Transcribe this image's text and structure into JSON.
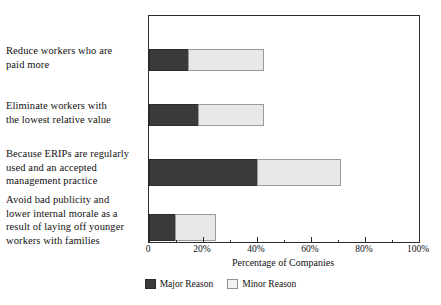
{
  "chart_data": {
    "type": "bar",
    "orientation": "horizontal",
    "stacked": true,
    "title": "",
    "xlabel": "Percentage of Companies",
    "ylabel": "",
    "xlim": [
      0,
      100
    ],
    "grid": false,
    "legend_position": "bottom-center",
    "categories": [
      "Reduce workers who are paid more",
      "Eliminate workers with the lowest relative value",
      "Because ERIPs are regularly used and an accepted management practice",
      "Avoid bad publicity and lower internal morale as a result of laying off younger workers with families"
    ],
    "series": [
      {
        "name": "Major Reason",
        "color": "#3a3a3a",
        "values": [
          14.5,
          18,
          40,
          9.5
        ]
      },
      {
        "name": "Minor Reason",
        "color": "#e8e8e8",
        "values": [
          28,
          24.5,
          31,
          15.5
        ]
      }
    ],
    "totals": [
      42.5,
      42.5,
      71,
      25
    ],
    "xticks": [
      0,
      20,
      40,
      60,
      80,
      100
    ],
    "xtick_labels": [
      "0",
      "20%",
      "40%",
      "60%",
      "80%",
      "100%"
    ]
  },
  "categories_display": [
    {
      "lines": [
        "Reduce workers who are",
        "paid more"
      ]
    },
    {
      "lines": [
        "Eliminate workers with",
        "the lowest relative value"
      ]
    },
    {
      "lines": [
        "Because ERIPs are regularly",
        "used and an accepted",
        "management practice"
      ]
    },
    {
      "lines": [
        "Avoid bad publicity and",
        "lower internal morale as a",
        "result of laying off younger",
        "workers with families"
      ]
    }
  ],
  "axis": {
    "x_title": "Percentage of Companies",
    "tick_labels": [
      "0",
      "20%",
      "40%",
      "60%",
      "80%",
      "100%"
    ]
  },
  "legend": {
    "items": [
      {
        "label": "Major Reason",
        "color": "#3a3a3a"
      },
      {
        "label": "Minor Reason",
        "color": "#e8e8e8"
      }
    ]
  }
}
